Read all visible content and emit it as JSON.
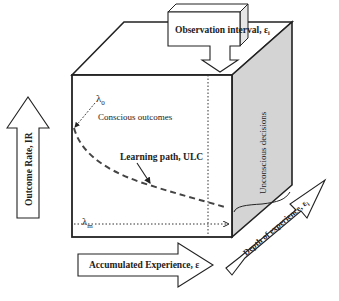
{
  "diagram": {
    "type": "3d-box-learning-curve",
    "colors": {
      "stroke": "#222222",
      "side_face": "#d4d4d4",
      "background": "#ffffff"
    },
    "labels": {
      "observation_interval": "Observation interval, ε",
      "observation_interval_sub": "i",
      "lambda_0": "λ",
      "lambda_0_sub": "0",
      "conscious_outcomes": "Conscious outcomes",
      "learning_path": "Learning path, ULC",
      "lambda_m": "λ",
      "lambda_m_sub": "m",
      "unconscious_decisions": "Unconscious decisions",
      "outcome_rate": "Outcome Rate, IR",
      "accumulated_experience": "Accumulated Experience, ε",
      "depth_of_experience": "Depth of experience, ε",
      "depth_of_experience_sub": "i"
    }
  }
}
